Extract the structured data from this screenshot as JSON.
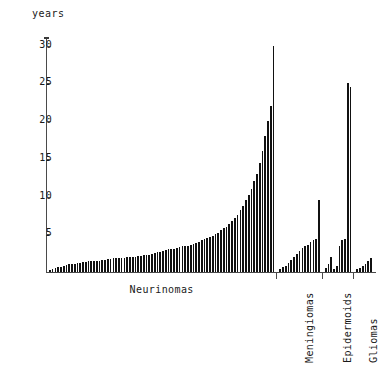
{
  "chart_data": {
    "type": "bar",
    "title": "",
    "ylabel": "years",
    "xlabel": "",
    "ylim": [
      0,
      31
    ],
    "yticks": [
      5,
      10,
      15,
      20,
      25,
      30
    ],
    "ytick_labels": [
      "5",
      "10",
      "15",
      "20",
      "25",
      "30"
    ],
    "grid": false,
    "legend": "none",
    "annotation": "Duration of symptoms (years) per individual patient, sorted ascending within each tumour type group.",
    "groups": [
      {
        "name": "Neurinomas",
        "label": "Neurinomas",
        "orientation": "horizontal",
        "values": [
          0.3,
          0.4,
          0.5,
          0.6,
          0.7,
          0.8,
          0.9,
          1.0,
          1.0,
          1.1,
          1.2,
          1.2,
          1.3,
          1.3,
          1.4,
          1.4,
          1.5,
          1.5,
          1.5,
          1.6,
          1.6,
          1.7,
          1.7,
          1.8,
          1.8,
          1.8,
          1.9,
          1.9,
          2.0,
          2.0,
          2.0,
          2.0,
          2.1,
          2.1,
          2.2,
          2.2,
          2.3,
          2.4,
          2.5,
          2.6,
          2.7,
          2.8,
          2.9,
          3.0,
          3.0,
          3.1,
          3.2,
          3.3,
          3.4,
          3.5,
          3.5,
          3.6,
          3.7,
          3.8,
          4.0,
          4.2,
          4.4,
          4.5,
          4.6,
          4.8,
          5.0,
          5.2,
          5.5,
          5.8,
          6.0,
          6.4,
          6.8,
          7.2,
          7.6,
          8.2,
          8.8,
          9.5,
          10.2,
          11.0,
          12.0,
          13.0,
          14.5,
          16.0,
          18.0,
          20.0,
          22.0,
          30.0
        ]
      },
      {
        "name": "Meningiomas",
        "label": "Meningiomas",
        "orientation": "vertical",
        "values": [
          0.4,
          0.6,
          0.8,
          1.2,
          1.6,
          2.0,
          2.4,
          2.8,
          3.2,
          3.4,
          3.6,
          4.0,
          4.2,
          4.4,
          9.6
        ]
      },
      {
        "name": "Epidermoids",
        "label": "Epidermoids",
        "orientation": "vertical",
        "values": [
          0.5,
          1.0,
          2.0,
          0.4,
          0.8,
          3.4,
          4.2,
          4.4,
          25.0,
          24.5
        ]
      },
      {
        "name": "Gliomas",
        "label": "Gliomas",
        "orientation": "vertical",
        "values": [
          0.4,
          0.5,
          0.8,
          1.0,
          1.4,
          1.8
        ]
      }
    ]
  },
  "axis": {
    "unit_label": "years"
  }
}
